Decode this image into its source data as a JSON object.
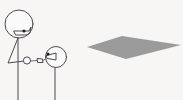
{
  "scene": {
    "title": "Two stick figures facing a gray diamond",
    "width": 183,
    "height": 100,
    "background_color": "#f7f6f5",
    "line_color": "#4a4a52",
    "eye_color": "#1d1d22"
  },
  "figures": [
    {
      "name": "tall-figure",
      "label": "Tall stick figure on the left facing right",
      "head": {
        "cx": 19,
        "cy": 24,
        "r": 14
      },
      "eye": {
        "cx": 24,
        "cy": 31,
        "r": 1.6
      },
      "face_profile": "pointed snout on lower-right of head",
      "body_line": {
        "x1": 18,
        "y1": 38,
        "x2": 18,
        "y2": 100
      },
      "arm_path": "from shoulder down-left to elbow then right to hand",
      "hand": {
        "cx": 27,
        "cy": 60,
        "r": 3.5
      }
    },
    {
      "name": "short-figure",
      "label": "Shorter stick figure on the right facing left",
      "head": {
        "cx": 56,
        "cy": 57,
        "r": 10.5
      },
      "eye": {
        "cx": 48,
        "cy": 54,
        "r": 1.5
      },
      "face_profile": "pointed snout on left of head",
      "body_line": {
        "x1": 55,
        "y1": 68,
        "x2": 55,
        "y2": 100
      },
      "hand": {
        "cx": 40,
        "cy": 61,
        "r": 2.6
      }
    }
  ],
  "shapes": [
    {
      "name": "gray-diamond",
      "type": "quadrilateral",
      "fill_color": "#9b9b9b",
      "points": "87,47 122,36 181,45 126,59",
      "description": "Flat gray rhombus / diamond suggesting a plane or platform"
    }
  ]
}
